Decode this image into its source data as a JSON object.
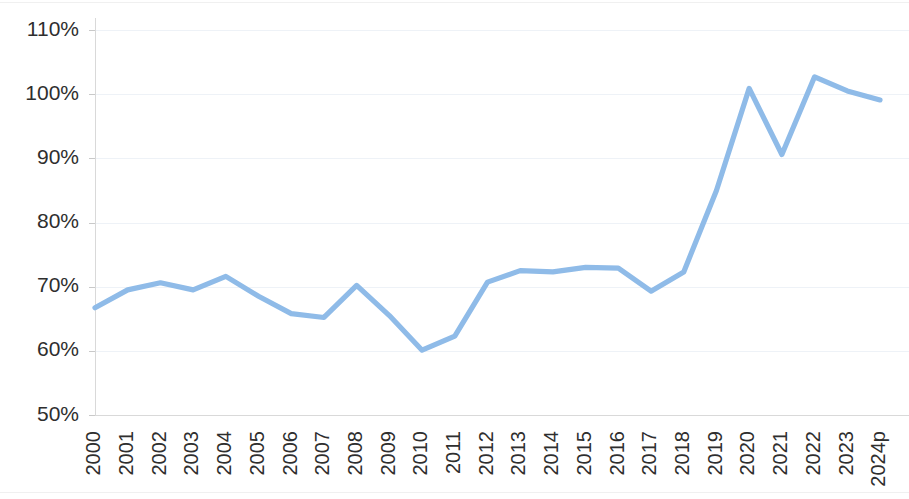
{
  "chart_data": {
    "type": "line",
    "title": "",
    "subtitle": "",
    "xlabel": "",
    "ylabel": "",
    "grid": true,
    "legend": "none",
    "line_color": "#8fbbe8",
    "axis_text_color": "#2e2e2e",
    "gridline_color": "#e9eef4",
    "ylim": [
      50,
      110
    ],
    "ytick_labels": [
      "110%",
      "100%",
      "90%",
      "80%",
      "70%",
      "60%",
      "50%"
    ],
    "ytick_values": [
      110,
      100,
      90,
      80,
      70,
      60,
      50
    ],
    "categories": [
      "2000",
      "2001",
      "2002",
      "2003",
      "2004",
      "2005",
      "2006",
      "2007",
      "2008",
      "2009",
      "2010",
      "2011",
      "2012",
      "2013",
      "2014",
      "2015",
      "2016",
      "2017",
      "2018",
      "2019",
      "2020",
      "2021",
      "2022",
      "2023",
      "2024p"
    ],
    "values": [
      66.7,
      69.5,
      70.6,
      69.5,
      71.6,
      68.5,
      65.8,
      65.2,
      70.2,
      65.5,
      60.1,
      62.3,
      70.7,
      72.5,
      72.3,
      73.0,
      72.9,
      69.3,
      72.3,
      85.0,
      100.9,
      90.6,
      102.7,
      100.5,
      99.1
    ],
    "series": [
      {
        "name": "",
        "color": "#8fbbe8",
        "values": [
          66.7,
          69.5,
          70.6,
          69.5,
          71.6,
          68.5,
          65.8,
          65.2,
          70.2,
          65.5,
          60.1,
          62.3,
          70.7,
          72.5,
          72.3,
          73.0,
          72.9,
          69.3,
          72.3,
          85.0,
          100.9,
          90.6,
          102.7,
          100.5,
          99.1
        ]
      }
    ]
  }
}
